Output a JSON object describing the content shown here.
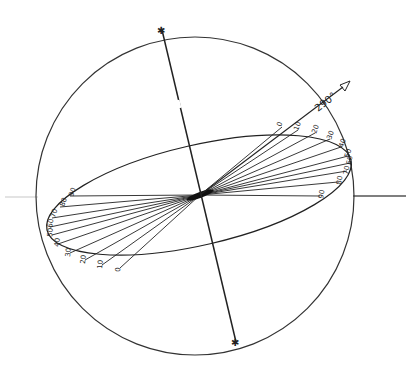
{
  "diagram": {
    "type": "sphere-projection",
    "sphere": {
      "cx": 195,
      "cy": 196,
      "r": 159
    },
    "axis": {
      "x1": 162,
      "y1": 28,
      "x2": 236,
      "y2": 342,
      "end_marker": "✱"
    },
    "ellipse": {
      "cx": 199,
      "cy": 195,
      "rx": 156,
      "ry": 50,
      "rotate": -13
    },
    "horizontal_line": {
      "y": 196,
      "left_x1": 5,
      "left_x2": 38,
      "right_x1": 352,
      "right_x2": 406
    },
    "direction_arrow": {
      "label": "290°",
      "x1": 200,
      "y1": 195,
      "x2": 350,
      "y2": 80
    },
    "right_labels": [
      "0",
      "10",
      "20",
      "30",
      "40",
      "50",
      "60",
      "70",
      "80",
      "90"
    ],
    "left_labels": [
      "90",
      "80",
      "70",
      "60",
      "50",
      "40",
      "30",
      "20",
      "10",
      "0"
    ],
    "colors": {
      "line": "#222222",
      "faint": "#bbbbbb",
      "background": "#ffffff"
    }
  }
}
